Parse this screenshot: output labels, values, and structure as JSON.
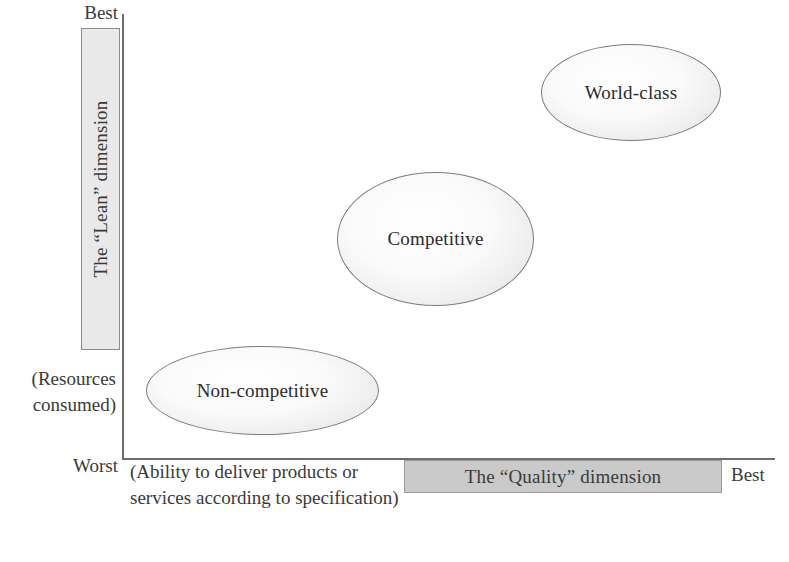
{
  "diagram": {
    "axes": {
      "y_top_label": "Best",
      "y_bottom_label": "Worst",
      "y_parenthetical": "(Resources\nconsumed)",
      "y_parenthetical_line1": "(Resources",
      "y_parenthetical_line2": "consumed)",
      "y_dimension_label": "The “Lean” dimension",
      "x_right_label": "Best",
      "x_dimension_label": "The “Quality” dimension",
      "x_parenthetical": "(Ability to deliver products or services according to specification)"
    },
    "bubbles": [
      {
        "label": "Non-competitive"
      },
      {
        "label": "Competitive"
      },
      {
        "label": "World-class"
      }
    ],
    "colors": {
      "axis": "#6d6d6d",
      "lean_bar_fill": "#e9e9e9",
      "quality_bar_fill": "#cacaca",
      "bubble_fill": "#f2f2f2",
      "bubble_stroke": "#7d7d7d",
      "text": "#2b2b2b"
    }
  }
}
